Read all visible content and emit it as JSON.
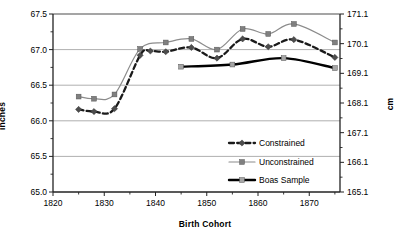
{
  "chart_data": {
    "type": "line",
    "title": "",
    "xlabel": "Birth Cohort",
    "ylabel": "inches",
    "ylabel_right": "cm",
    "xlim": [
      1820,
      1876
    ],
    "ylim": [
      65.0,
      67.5
    ],
    "ylim_right": [
      165.1,
      171.1
    ],
    "grid": true,
    "legend_position": "bottom-right",
    "xticks": [
      "1820",
      "1830",
      "1840",
      "1850",
      "1860",
      "1870"
    ],
    "xtick_values": [
      1820,
      1830,
      1840,
      1850,
      1860,
      1870
    ],
    "xminor_values": [
      1825,
      1835,
      1845,
      1855,
      1865,
      1875
    ],
    "yticks": [
      "65.0",
      "65.5",
      "66.0",
      "66.5",
      "67.0",
      "67.5"
    ],
    "ytick_values": [
      65.0,
      65.5,
      66.0,
      66.5,
      67.0,
      67.5
    ],
    "yticks_right": [
      "165.1",
      "166.1",
      "167.1",
      "168.1",
      "169.1",
      "170.1",
      "171.1"
    ],
    "ytick_right_values": [
      165.1,
      166.1,
      167.1,
      168.1,
      169.1,
      170.1,
      171.1
    ],
    "series": [
      {
        "name": "Constrained",
        "color": "#1a1a1a",
        "style": "dashed",
        "marker": "diamond",
        "marker_color": "#4d4d4d",
        "x": [
          1825,
          1828,
          1832,
          1837,
          1839,
          1842,
          1847,
          1852,
          1857,
          1862,
          1867,
          1875
        ],
        "values": [
          66.16,
          66.13,
          66.17,
          66.92,
          66.98,
          66.97,
          67.03,
          66.88,
          67.15,
          67.04,
          67.14,
          66.89
        ]
      },
      {
        "name": "Unconstrained",
        "color": "#8c8c8c",
        "style": "solid",
        "marker": "square",
        "marker_color": "#808080",
        "x": [
          1825,
          1828,
          1832,
          1837,
          1842,
          1847,
          1852,
          1857,
          1862,
          1867,
          1875
        ],
        "values": [
          66.34,
          66.31,
          66.37,
          67.01,
          67.1,
          67.15,
          67.0,
          67.29,
          67.22,
          67.36,
          67.1
        ]
      },
      {
        "name": "Boas Sample",
        "color": "#000000",
        "style": "solid-thick",
        "marker": "square",
        "marker_color": "#a6a6a6",
        "x": [
          1845,
          1855,
          1865,
          1875
        ],
        "values": [
          66.76,
          66.79,
          66.88,
          66.74
        ]
      }
    ]
  },
  "legend": {
    "items": [
      {
        "label": "Constrained"
      },
      {
        "label": "Unconstrained"
      },
      {
        "label": "Boas Sample"
      }
    ]
  }
}
